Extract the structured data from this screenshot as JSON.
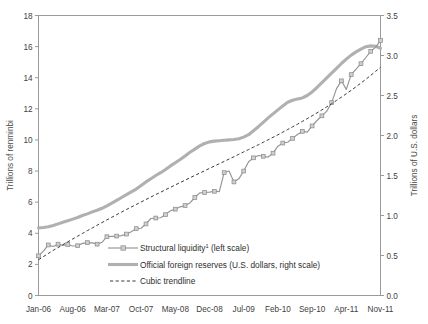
{
  "chart_data": {
    "type": "line",
    "title": "",
    "xlabel": "",
    "ylabel": "Trillions of renminbi",
    "y2label": "Trillions of U.S. dollars",
    "ylim": [
      0,
      18
    ],
    "y2lim": [
      0,
      3.5
    ],
    "grid": false,
    "legend_position": "inside-bottom-left",
    "y_ticks": [
      "0",
      "2",
      "4",
      "6",
      "8",
      "10",
      "12",
      "14",
      "16",
      "18"
    ],
    "y2_ticks": [
      "0.0",
      "0.5",
      "1.0",
      "1.5",
      "2.0",
      "2.5",
      "3.0",
      "3.5"
    ],
    "x_ticks": [
      "Jan-06",
      "Aug-06",
      "Mar-07",
      "Oct-07",
      "May-08",
      "Dec-08",
      "Jul-09",
      "Feb-10",
      "Sep-10",
      "Apr-11",
      "Nov-11"
    ],
    "x_tick_indices": [
      0,
      7,
      14,
      21,
      28,
      35,
      42,
      49,
      56,
      63,
      70
    ],
    "x_count": 71,
    "series": [
      {
        "name": "Structural liquidity¹ (left scale)",
        "axis": "left",
        "style": "line-marker",
        "color": "#949494",
        "values": [
          2.55,
          2.85,
          3.25,
          3.15,
          3.3,
          3.22,
          3.28,
          3.18,
          3.2,
          3.35,
          3.4,
          3.38,
          3.3,
          3.42,
          3.78,
          3.8,
          3.82,
          3.85,
          3.95,
          4.1,
          4.3,
          4.32,
          4.6,
          4.95,
          4.98,
          5.0,
          5.2,
          5.45,
          5.55,
          5.7,
          5.78,
          5.95,
          6.3,
          6.6,
          6.62,
          6.65,
          6.7,
          6.68,
          7.9,
          8.0,
          7.3,
          7.5,
          8.0,
          8.6,
          8.85,
          9.0,
          8.95,
          8.9,
          9.15,
          9.6,
          9.8,
          9.85,
          10.1,
          10.35,
          10.55,
          10.5,
          10.9,
          11.25,
          11.55,
          11.85,
          12.4,
          13.3,
          13.8,
          13.25,
          14.2,
          14.55,
          14.9,
          15.3,
          15.7,
          15.95,
          16.4
        ]
      },
      {
        "name": "Official foreign reserves (U.S. dollars, right scale)",
        "axis": "right",
        "style": "thick-line",
        "color": "#b0b0b0",
        "values": [
          0.845,
          0.85,
          0.86,
          0.875,
          0.895,
          0.915,
          0.935,
          0.955,
          0.975,
          1.0,
          1.02,
          1.045,
          1.065,
          1.09,
          1.12,
          1.155,
          1.19,
          1.225,
          1.26,
          1.295,
          1.33,
          1.375,
          1.42,
          1.46,
          1.5,
          1.535,
          1.575,
          1.62,
          1.66,
          1.7,
          1.745,
          1.79,
          1.83,
          1.87,
          1.9,
          1.92,
          1.93,
          1.935,
          1.94,
          1.945,
          1.95,
          1.96,
          1.98,
          2.01,
          2.06,
          2.11,
          2.165,
          2.22,
          2.27,
          2.32,
          2.37,
          2.415,
          2.44,
          2.455,
          2.47,
          2.5,
          2.545,
          2.6,
          2.66,
          2.72,
          2.78,
          2.84,
          2.9,
          2.955,
          3.005,
          3.045,
          3.08,
          3.11,
          3.12,
          3.115,
          3.09
        ]
      },
      {
        "name": "Cubic trendline",
        "axis": "left",
        "style": "dashed",
        "color": "#3a3a3a",
        "values": [
          2.3,
          2.5,
          2.7,
          2.9,
          3.08,
          3.27,
          3.45,
          3.63,
          3.81,
          3.99,
          4.17,
          4.34,
          4.52,
          4.69,
          4.86,
          5.03,
          5.2,
          5.36,
          5.53,
          5.69,
          5.85,
          6.01,
          6.17,
          6.33,
          6.49,
          6.64,
          6.8,
          6.95,
          7.11,
          7.26,
          7.41,
          7.57,
          7.72,
          7.87,
          8.02,
          8.17,
          8.32,
          8.47,
          8.62,
          8.77,
          8.92,
          9.08,
          9.23,
          9.38,
          9.54,
          9.69,
          9.85,
          10.01,
          10.17,
          10.33,
          10.5,
          10.67,
          10.84,
          11.01,
          11.19,
          11.37,
          11.55,
          11.74,
          11.93,
          12.13,
          12.33,
          12.54,
          12.75,
          12.97,
          13.19,
          13.42,
          13.66,
          13.9,
          14.15,
          14.41,
          14.67
        ]
      }
    ]
  },
  "legend": {
    "items": [
      {
        "label_main": "Structural liquidity",
        "sup": "1",
        "label_tail": " (left scale)",
        "marker": "line-square-marker"
      },
      {
        "label_main": "Official foreign reserves (U.S. dollars, right scale)",
        "sup": "",
        "label_tail": "",
        "marker": "thick-line"
      },
      {
        "label_main": "Cubic trendline",
        "sup": "",
        "label_tail": "",
        "marker": "dashed-line"
      }
    ]
  },
  "colors": {
    "liquidity": "#949494",
    "reserves": "#b0b0b0",
    "trendline": "#3a3a3a",
    "border": "#9a9a9a",
    "text": "#3b3b3b"
  }
}
